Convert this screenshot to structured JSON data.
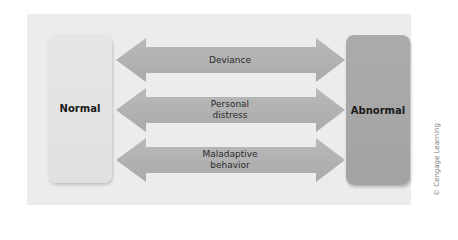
{
  "diagram": {
    "left_box": {
      "label": "Normal",
      "color": "#e3e3e3"
    },
    "right_box": {
      "label": "Abnormal",
      "color": "#a7a7a7"
    },
    "arrows": [
      {
        "label_lines": [
          "Deviance"
        ],
        "label": "Deviance",
        "direction": "bidirectional"
      },
      {
        "label_lines": [
          "Personal",
          "distress"
        ],
        "label": "Personal distress",
        "direction": "bidirectional"
      },
      {
        "label_lines": [
          "Maladaptive",
          "behavior"
        ],
        "label": "Maladaptive behavior",
        "direction": "bidirectional"
      }
    ],
    "arrow_color": "#b1b1b1",
    "panel_color": "#ececec",
    "credit": "© Cengage Learning"
  }
}
